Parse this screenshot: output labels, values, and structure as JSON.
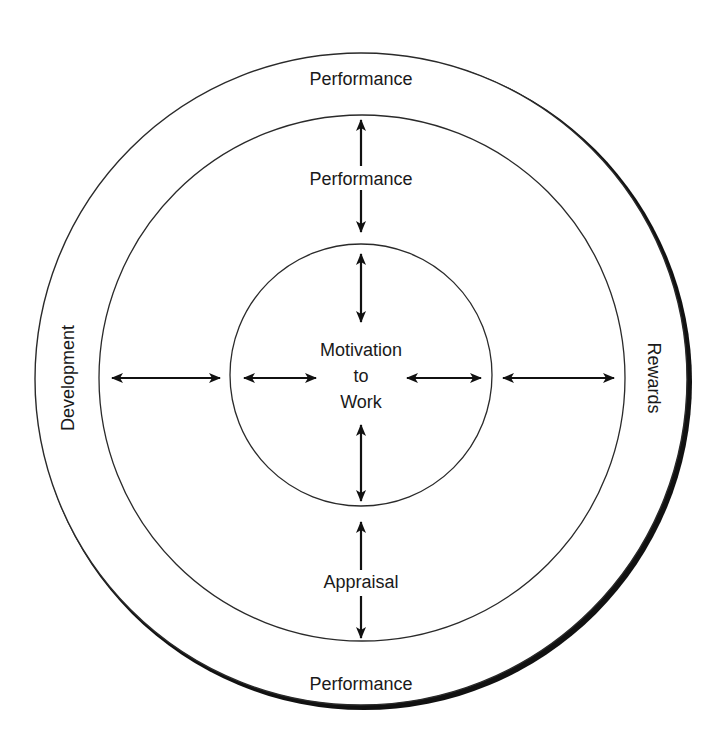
{
  "diagram": {
    "outer_ring": {
      "top_label": "Performance",
      "bottom_label": "Performance",
      "left_label": "Development",
      "right_label": "Rewards"
    },
    "middle_ring": {
      "top_label": "Performance",
      "bottom_label": "Appraisal"
    },
    "center": {
      "line1": "Motivation",
      "line2": "to",
      "line3": "Work"
    },
    "colors": {
      "stroke": "#2a2a2a",
      "shadow": "#111111",
      "text": "#1a1a1a",
      "background": "#ffffff"
    }
  }
}
